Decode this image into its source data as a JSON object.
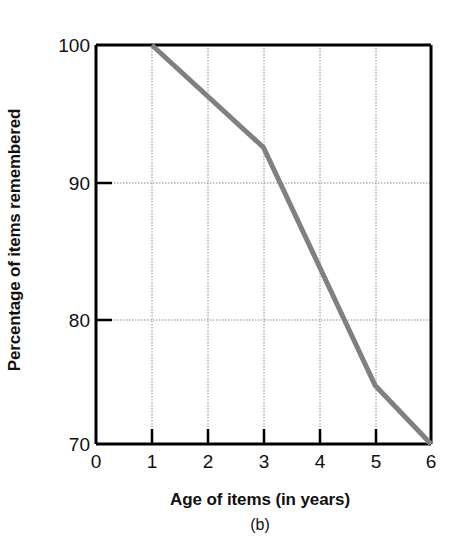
{
  "chart_data": {
    "type": "line",
    "title": "",
    "subtitle": "",
    "panel_label": "(b)",
    "xlabel": "Age of items (in years)",
    "ylabel": "Percentage of items remembered",
    "xlim": [
      0,
      6
    ],
    "ylim": [
      70,
      100
    ],
    "xticks": [
      0,
      1,
      2,
      3,
      4,
      5,
      6
    ],
    "xtick_labels": [
      "0",
      "1",
      "2",
      "3",
      "4",
      "5",
      "6"
    ],
    "yticks": [
      70,
      80,
      90,
      100
    ],
    "ytick_labels": [
      "70",
      "80",
      "90",
      "100"
    ],
    "grid": true,
    "grid_style": "dotted",
    "grid_color": "#8a8a8a",
    "legend": null,
    "line_color": "#808080",
    "line_width": 5,
    "axis_color": "#000000",
    "background": "#ffffff",
    "series": [
      {
        "name": "Percentage of items remembered",
        "x": [
          1,
          3,
          5,
          6
        ],
        "values": [
          100,
          92.3,
          74.4,
          70
        ]
      }
    ]
  }
}
